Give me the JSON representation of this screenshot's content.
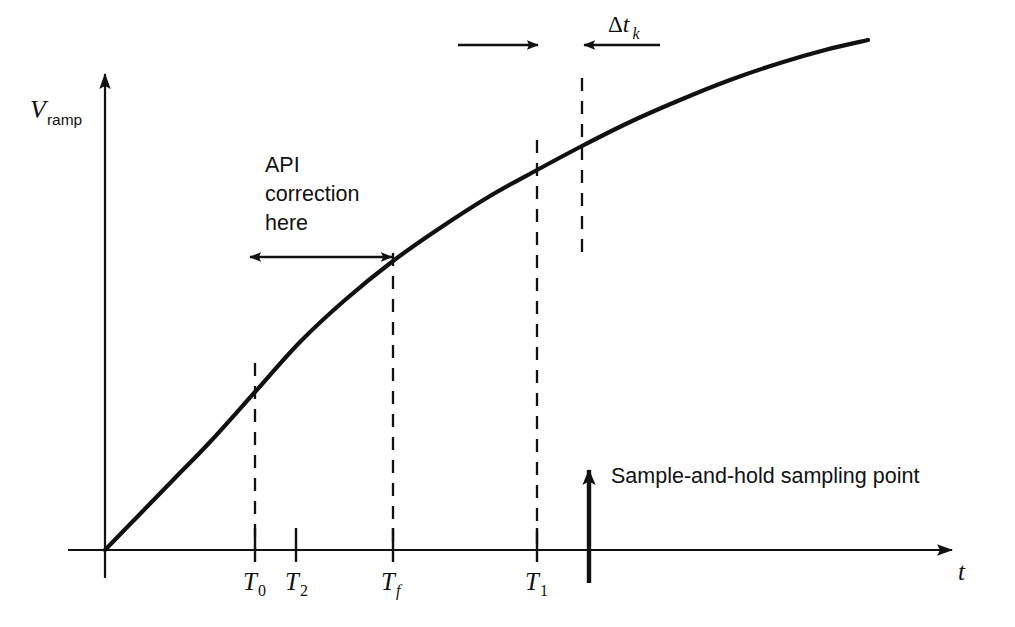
{
  "figure": {
    "kind": "timing-diagram",
    "background_color": "#ffffff",
    "ink_color": "#111111"
  },
  "axes": {
    "y_label": {
      "symbol": "V",
      "subscript": "ramp"
    },
    "x_label": {
      "symbol": "t"
    },
    "origin_label": ""
  },
  "annotations": {
    "api_note_line1": "API",
    "api_note_line2": "correction",
    "api_note_line3": "here",
    "sample_note": "Sample-and-hold sampling point",
    "delta_symbol": "Δ",
    "delta_var": "t",
    "delta_sub": "k"
  },
  "tick_labels": [
    {
      "id": "T0",
      "symbol": "T",
      "subscript": "0",
      "x": 255
    },
    {
      "id": "T2",
      "symbol": "T",
      "subscript": "2",
      "x": 296
    },
    {
      "id": "Tf",
      "symbol": "T",
      "subscript": "f",
      "subscript_italic": true,
      "x": 393
    },
    {
      "id": "T1",
      "symbol": "T",
      "subscript": "1",
      "x": 537
    }
  ],
  "chart_data": {
    "type": "line",
    "title": "",
    "xlabel": "t",
    "ylabel": "V_ramp",
    "grid": false,
    "legend": "none",
    "axis_pixel": {
      "origin_x": 105,
      "origin_y": 550,
      "y_axis_top": 62,
      "x_axis_left": 68,
      "x_axis_right": 960
    },
    "curve_points": [
      [
        105,
        550
      ],
      [
        140,
        514
      ],
      [
        175,
        478
      ],
      [
        210,
        442
      ],
      [
        255,
        392
      ],
      [
        300,
        342
      ],
      [
        345,
        300
      ],
      [
        393,
        261
      ],
      [
        440,
        228
      ],
      [
        490,
        196
      ],
      [
        537,
        170
      ],
      [
        582,
        146
      ],
      [
        630,
        122
      ],
      [
        680,
        100
      ],
      [
        730,
        80
      ],
      [
        780,
        63
      ],
      [
        825,
        50
      ],
      [
        868,
        40
      ]
    ],
    "vertical_markers": [
      {
        "name": "T0-dashed",
        "x": 255,
        "y_top": 363,
        "y_bottom": 550,
        "style": "dashed"
      },
      {
        "name": "Tf-dashed",
        "x": 393,
        "y_top": 253,
        "y_bottom": 550,
        "style": "dashed"
      },
      {
        "name": "T1-dashed",
        "x": 537,
        "y_top": 140,
        "y_bottom": 550,
        "style": "dashed"
      },
      {
        "name": "dtk-dashed",
        "x": 582,
        "y_top": 78,
        "y_bottom": 255,
        "style": "dashed"
      }
    ],
    "tick_marks": [
      {
        "name": "T0-tick",
        "x": 255,
        "y_top": 528,
        "y_bottom": 562
      },
      {
        "name": "T2-tick",
        "x": 296,
        "y_top": 528,
        "y_bottom": 562
      },
      {
        "name": "Tf-tick",
        "x": 393,
        "y_top": 528,
        "y_bottom": 562
      },
      {
        "name": "T1-tick",
        "x": 537,
        "y_top": 528,
        "y_bottom": 562
      }
    ],
    "measure_arrows": [
      {
        "name": "api-correction-span",
        "y": 257,
        "x_from": 250,
        "x_to": 392,
        "heads": "both"
      },
      {
        "name": "dtk-left-arrow",
        "y": 45,
        "x_from": 458,
        "x_to": 538,
        "heads": "end"
      },
      {
        "name": "dtk-right-arrow",
        "y": 45,
        "x_from": 660,
        "x_to": 582,
        "heads": "end"
      }
    ],
    "sample_arrow": {
      "name": "sample-and-hold-arrow",
      "x": 589,
      "y_from": 583,
      "y_to": 462
    }
  }
}
